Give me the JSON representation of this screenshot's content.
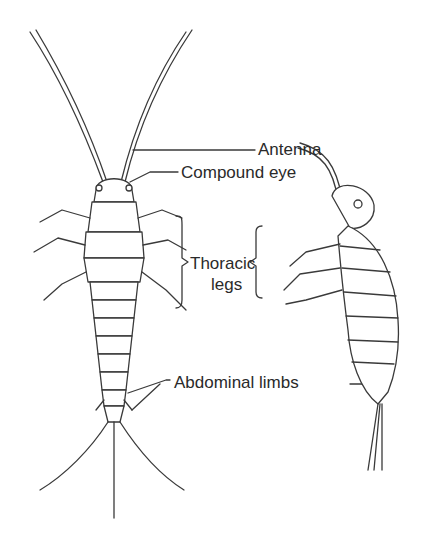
{
  "figure": {
    "labels": {
      "antenna": "Antenna",
      "compound_eye": "Compound eye",
      "thoracic_legs_line1": "Thoracic",
      "thoracic_legs_line2": "legs",
      "abdominal_limbs": "Abdominal limbs"
    },
    "views": [
      "dorsal-view",
      "lateral-view"
    ],
    "colors": {
      "ink": "#3a3a3a",
      "background": "#ffffff"
    }
  }
}
